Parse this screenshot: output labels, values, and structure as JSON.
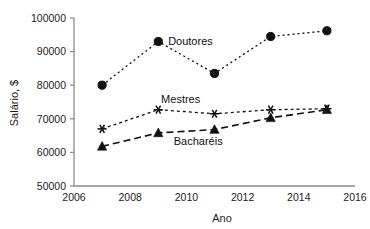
{
  "chart_data": {
    "type": "line",
    "title": "",
    "xlabel": "Ano",
    "ylabel": "Salário, $",
    "xlim": [
      2006,
      2016
    ],
    "ylim": [
      50000,
      100000
    ],
    "xticks": [
      2006,
      2008,
      2010,
      2012,
      2014,
      2016
    ],
    "xtick_labels": [
      "2006",
      "2008",
      "2010",
      "2012",
      "2014",
      "2016"
    ],
    "yticks": [
      50000,
      60000,
      70000,
      80000,
      90000,
      100000
    ],
    "ytick_labels": [
      "50000",
      "60000",
      "70000",
      "80000",
      "90000",
      "100000"
    ],
    "grid": false,
    "legend_position": "inline-annotations",
    "x": [
      2007,
      2009,
      2011,
      2013,
      2015
    ],
    "series": [
      {
        "name": "Doutores",
        "values": [
          80000,
          93000,
          83500,
          94500,
          96200
        ],
        "marker": "circle",
        "dash": "2,3",
        "line_width": 1.3,
        "color": "#111111",
        "label_x": 2009.35,
        "label_y": 93000
      },
      {
        "name": "Mestres",
        "values": [
          67000,
          72700,
          71500,
          72700,
          73000
        ],
        "marker": "asterisk",
        "dash": "3,3",
        "line_width": 1.3,
        "color": "#111111",
        "label_x": 2009.1,
        "label_y": 75700
      },
      {
        "name": "Bacharéis",
        "values": [
          61800,
          65800,
          66800,
          70300,
          72700
        ],
        "marker": "triangle",
        "dash": "7,4",
        "line_width": 1.6,
        "color": "#111111",
        "label_x": 2009.55,
        "label_y": 63300
      }
    ]
  },
  "figure": {
    "background_color": "#ffffff",
    "axis_color": "#8a8a8a",
    "text_color": "#1c1c1c"
  }
}
